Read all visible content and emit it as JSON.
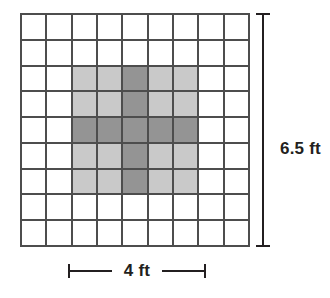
{
  "figure": {
    "grid": {
      "columns": 9,
      "rows": 9,
      "line_color": "#4d4d4d",
      "cell_color": "#ffffff"
    },
    "colors": {
      "shade_light": "#c9c9c9",
      "shade_dark": "#949494",
      "ink": "#231f20",
      "background": "#ffffff"
    },
    "shading": {
      "light_block": {
        "col_start": 2,
        "col_end": 6,
        "row_start": 2,
        "row_end": 6,
        "description": "5 by 5 light gray block"
      },
      "dark_cross": {
        "center_col": 4,
        "center_row": 4,
        "description": "dark gray plus shape: full middle row and full middle column of the shaded block"
      },
      "cells": [
        [
          "white",
          "white",
          "white",
          "white",
          "white",
          "white",
          "white",
          "white",
          "white"
        ],
        [
          "white",
          "white",
          "white",
          "white",
          "white",
          "white",
          "white",
          "white",
          "white"
        ],
        [
          "white",
          "white",
          "light",
          "light",
          "dark",
          "light",
          "light",
          "white",
          "white"
        ],
        [
          "white",
          "white",
          "light",
          "light",
          "dark",
          "light",
          "light",
          "white",
          "white"
        ],
        [
          "white",
          "white",
          "dark",
          "dark",
          "dark",
          "dark",
          "dark",
          "white",
          "white"
        ],
        [
          "white",
          "white",
          "light",
          "light",
          "dark",
          "light",
          "light",
          "white",
          "white"
        ],
        [
          "white",
          "white",
          "light",
          "light",
          "dark",
          "light",
          "light",
          "white",
          "white"
        ],
        [
          "white",
          "white",
          "white",
          "white",
          "white",
          "white",
          "white",
          "white",
          "white"
        ],
        [
          "white",
          "white",
          "white",
          "white",
          "white",
          "white",
          "white",
          "white",
          "white"
        ]
      ]
    },
    "dimensions": {
      "vertical": {
        "label": "6.5 ft",
        "value": 6.5,
        "unit": "ft",
        "orientation": "vertical",
        "position": "right"
      },
      "horizontal": {
        "label": "4 ft",
        "value": 4,
        "unit": "ft",
        "orientation": "horizontal",
        "position": "bottom"
      }
    }
  }
}
